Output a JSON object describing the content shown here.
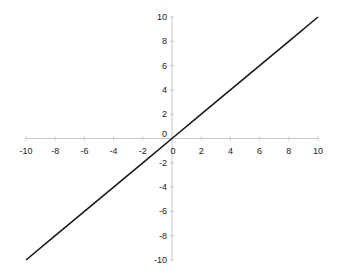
{
  "chart_data": {
    "type": "line",
    "title": "",
    "xlabel": "",
    "ylabel": "",
    "xlim": [
      -10,
      10
    ],
    "ylim": [
      -10,
      10
    ],
    "grid": false,
    "legend": null,
    "x_ticks": [
      -10,
      -8,
      -6,
      -4,
      -2,
      0,
      2,
      4,
      6,
      8,
      10
    ],
    "y_ticks": [
      -10,
      -8,
      -6,
      -4,
      -2,
      0,
      2,
      4,
      6,
      8,
      10
    ],
    "series": [
      {
        "name": "y = x",
        "color": "#1a1a1a",
        "x": [
          -10,
          -8,
          -6,
          -4,
          -2,
          0,
          2,
          4,
          6,
          8,
          10
        ],
        "y": [
          -10,
          -8,
          -6,
          -4,
          -2,
          0,
          2,
          4,
          6,
          8,
          10
        ]
      }
    ],
    "axis_color": "#c8c8c8"
  }
}
